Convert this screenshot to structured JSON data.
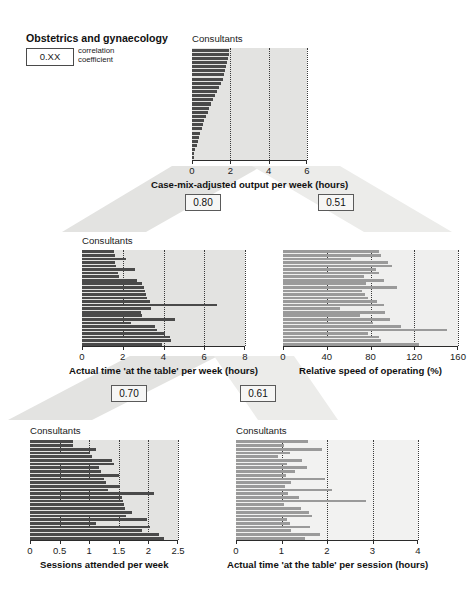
{
  "title": "Obstetrics and gynaecology",
  "legend": {
    "sample_value": "0.XX",
    "line1": "correlation",
    "line2": "coefficient"
  },
  "colors": {
    "bar_dark": "#4a4a4a",
    "bar_mid": "#9a9a9a",
    "panel_bg": "#e3e3e1",
    "panel_bg_light": "#ececea",
    "band": "#e3e3e1",
    "axis": "#2b2b2b"
  },
  "correlations": [
    {
      "name": "corr-top-left",
      "value": "0.80"
    },
    {
      "name": "corr-top-right",
      "value": "0.51"
    },
    {
      "name": "corr-bottom-left",
      "value": "0.70"
    },
    {
      "name": "corr-bottom-right",
      "value": "0.61"
    }
  ],
  "chart_data": [
    {
      "id": "case-mix-adjusted-output",
      "type": "bar",
      "orientation": "horizontal",
      "title": "",
      "xlabel": "Case-mix-adjusted output per week (hours)",
      "ylabel": "Consultants",
      "xlim": [
        0,
        6
      ],
      "xticks": [
        0,
        2,
        4,
        6
      ],
      "xticklabels": [
        "0",
        "2",
        "4",
        "6"
      ],
      "grid": true,
      "bar_color": "#4a4a4a",
      "values": [
        1.95,
        1.92,
        1.9,
        1.85,
        1.78,
        1.72,
        1.66,
        1.6,
        1.5,
        1.42,
        1.33,
        1.2,
        1.08,
        0.98,
        0.9,
        0.82,
        0.72,
        0.63,
        0.56,
        0.5,
        0.42,
        0.36,
        0.3,
        0.24,
        0.18,
        0.12,
        0.08
      ]
    },
    {
      "id": "actual-time-at-the-table-per-week",
      "type": "bar",
      "orientation": "horizontal",
      "title": "",
      "xlabel": "Actual time 'at the table' per week (hours)",
      "ylabel": "Consultants",
      "xlim": [
        0,
        8
      ],
      "xticks": [
        0,
        2,
        4,
        6,
        8
      ],
      "xticklabels": [
        "0",
        "2",
        "4",
        "6",
        "8"
      ],
      "grid": true,
      "bar_color": "#4a4a4a",
      "values": [
        1.55,
        1.6,
        2.15,
        1.62,
        1.68,
        2.6,
        1.75,
        1.8,
        2.7,
        2.95,
        3.05,
        3.1,
        3.15,
        3.2,
        3.35,
        6.65,
        3.4,
        2.9,
        2.95,
        4.55,
        2.4,
        3.6,
        3.7,
        4.05,
        4.3,
        4.35,
        3.95
      ]
    },
    {
      "id": "relative-speed-of-operating",
      "type": "bar",
      "orientation": "horizontal",
      "title": "",
      "xlabel": "Relative speed of operating (%)",
      "ylabel": "",
      "xlim": [
        0,
        160
      ],
      "xticks": [
        0,
        40,
        80,
        120,
        160
      ],
      "xticklabels": [
        "0",
        "40",
        "80",
        "120",
        "160"
      ],
      "grid": true,
      "bar_color": "#9a9a9a",
      "values": [
        88,
        90,
        62,
        96,
        100,
        85,
        88,
        74,
        92,
        76,
        104,
        72,
        75,
        78,
        86,
        92,
        52,
        93,
        70,
        98,
        82,
        108,
        150,
        78,
        88,
        90,
        124
      ]
    },
    {
      "id": "sessions-attended-per-week",
      "type": "bar",
      "orientation": "horizontal",
      "title": "",
      "xlabel": "Sessions attended per week",
      "ylabel": "Consultants",
      "xlim": [
        0,
        2.5
      ],
      "xticks": [
        0,
        0.5,
        1,
        1.5,
        2,
        2.5
      ],
      "xticklabels": [
        "0",
        "0.5",
        "1",
        "1.5",
        "2",
        "2.5"
      ],
      "grid": true,
      "bar_color": "#4a4a4a",
      "values": [
        0.72,
        0.73,
        1.12,
        1.02,
        1.05,
        1.38,
        1.42,
        1.16,
        1.2,
        1.5,
        1.25,
        1.28,
        1.52,
        1.32,
        2.1,
        1.55,
        1.57,
        1.58,
        1.6,
        1.72,
        1.62,
        1.98,
        1.12,
        2.02,
        1.9,
        2.18,
        2.26
      ]
    },
    {
      "id": "actual-time-at-the-table-per-session",
      "type": "bar",
      "orientation": "horizontal",
      "title": "",
      "xlabel": "Actual time 'at the table' per session (hours)",
      "ylabel": "Consultants",
      "xlim": [
        0,
        4
      ],
      "xticks": [
        0,
        1,
        2,
        3,
        4
      ],
      "xticklabels": [
        "0",
        "1",
        "2",
        "3",
        "4"
      ],
      "grid": true,
      "bar_color": "#9a9a9a",
      "values": [
        1.58,
        1.06,
        1.88,
        1.18,
        0.92,
        1.45,
        1.12,
        1.55,
        1.3,
        1.1,
        1.95,
        1.2,
        1.08,
        2.1,
        1.15,
        1.38,
        2.85,
        1.05,
        1.42,
        1.6,
        1.68,
        1.12,
        1.18,
        1.62,
        1.2,
        1.85,
        1.52
      ]
    }
  ]
}
